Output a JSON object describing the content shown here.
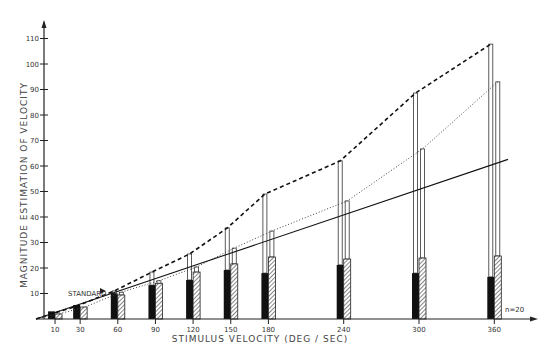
{
  "chart_data": {
    "type": "bar",
    "title": "",
    "xlabel": "STIMULUS VELOCITY (DEG / SEC)",
    "ylabel": "MAGNITUDE ESTIMATION OF VELOCITY",
    "ylim": [
      0,
      115
    ],
    "yticks": [
      10,
      20,
      30,
      40,
      50,
      60,
      70,
      80,
      90,
      100,
      110
    ],
    "categories": [
      "10",
      "30",
      "60",
      "90",
      "120",
      "150",
      "180",
      "240",
      "300",
      "360"
    ],
    "x": [
      10,
      30,
      60,
      90,
      120,
      150,
      180,
      240,
      300,
      360
    ],
    "series": [
      {
        "name": "solid bar",
        "style": "black",
        "values": [
          3,
          5.5,
          10,
          13.3,
          15.3,
          19.2,
          18,
          21.2,
          18,
          16.5
        ]
      },
      {
        "name": "hatched bar",
        "style": "hatched",
        "values": [
          2,
          4.7,
          9.4,
          14,
          18.4,
          21.6,
          24.3,
          23.5,
          23.9,
          24.7
        ]
      },
      {
        "name": "open bar (above solid) / dashed line",
        "style": "open-dashed",
        "values": [
          2,
          5,
          11,
          18.4,
          25.5,
          35.7,
          49,
          62,
          88.6,
          107.8
        ]
      },
      {
        "name": "open bar (above hatched) / dotted line",
        "style": "open-dotted",
        "values": [
          2,
          4.5,
          10.5,
          15,
          20.4,
          27.8,
          34.5,
          46.3,
          66.7,
          93
        ]
      },
      {
        "name": "linear reference (solid line)",
        "style": "line",
        "values": [
          1.7,
          5.2,
          10.5,
          15.7,
          20.9,
          26.1,
          31.3,
          41.7,
          52.2,
          62.6
        ]
      }
    ],
    "annotations": [
      {
        "text": "STANDARD",
        "x": 60,
        "y": 10
      },
      {
        "text": "n=20",
        "position": "bottom-right"
      }
    ],
    "grid": false,
    "legend": "none"
  },
  "labels": {
    "standard": "STANDARD",
    "n": "n=20"
  }
}
